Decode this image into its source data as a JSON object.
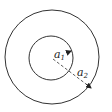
{
  "diagram": {
    "center": {
      "x": 52,
      "y": 57
    },
    "inner_circle": {
      "radius": 22,
      "label": "a",
      "subscript": "1"
    },
    "outer_circle": {
      "radius": 47,
      "label": "a",
      "subscript": "2"
    },
    "colors": {
      "stroke": "#333333",
      "background": "#ffffff"
    }
  }
}
